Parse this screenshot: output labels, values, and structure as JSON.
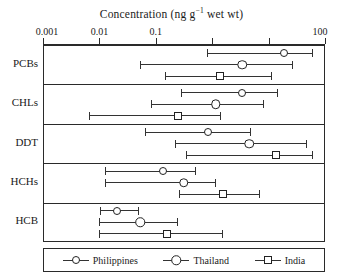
{
  "chart_data": {
    "type": "scatter",
    "orientation": "horizontal",
    "scale": "log",
    "title": "",
    "xlabel": "Concentration (ng g−1 wet wt)",
    "xlabel_parts": {
      "pre": "Concentration (ng g",
      "sup": "−1",
      "post": " wet wt)"
    },
    "ylabel": "",
    "xlim": [
      0.001,
      100
    ],
    "xticks": [
      0.001,
      0.01,
      0.1,
      1,
      10,
      100
    ],
    "xtick_labels": [
      "0.001",
      "0.01",
      "0.1",
      "1",
      "10",
      "100"
    ],
    "xtick_labels_shown": [
      "0.001",
      "0.01",
      "0.1",
      "",
      "",
      "100"
    ],
    "grid": false,
    "legend_position": "bottom",
    "categories": [
      "PCBs",
      "CHLs",
      "DDT",
      "HCHs",
      "HCB"
    ],
    "series": [
      {
        "name": "Philippines",
        "marker": "circle-sm",
        "points": [
          {
            "category": "PCBs",
            "value": 18.0,
            "low": 0.79,
            "high": 60.0
          },
          {
            "category": "CHLs",
            "value": 3.3,
            "low": 0.27,
            "high": 14.0
          },
          {
            "category": "DDT",
            "value": 0.82,
            "low": 0.062,
            "high": 4.6
          },
          {
            "category": "HCHs",
            "value": 0.13,
            "low": 0.012,
            "high": 0.5
          },
          {
            "category": "HCB",
            "value": 0.02,
            "low": 0.0098,
            "high": 0.049
          }
        ]
      },
      {
        "name": "Thailand",
        "marker": "circle-lg",
        "points": [
          {
            "category": "PCBs",
            "value": 3.3,
            "low": 0.05,
            "high": 26.0
          },
          {
            "category": "CHLs",
            "value": 1.1,
            "low": 0.079,
            "high": 7.8
          },
          {
            "category": "DDT",
            "value": 4.4,
            "low": 0.21,
            "high": 46.0
          },
          {
            "category": "HCHs",
            "value": 0.3,
            "low": 0.012,
            "high": 1.1
          },
          {
            "category": "HCB",
            "value": 0.051,
            "low": 0.0096,
            "high": 0.24
          }
        ]
      },
      {
        "name": "India",
        "marker": "square",
        "points": [
          {
            "category": "PCBs",
            "value": 1.3,
            "low": 0.14,
            "high": 11.0
          },
          {
            "category": "CHLs",
            "value": 0.24,
            "low": 0.0062,
            "high": 1.4
          },
          {
            "category": "DDT",
            "value": 13.0,
            "low": 0.33,
            "high": 60.0
          },
          {
            "category": "HCHs",
            "value": 1.5,
            "low": 0.25,
            "high": 6.8
          },
          {
            "category": "HCB",
            "value": 0.15,
            "low": 0.0096,
            "high": 1.5
          }
        ]
      }
    ]
  },
  "legend": {
    "items": [
      {
        "label": "Philippines",
        "marker": "circle-sm"
      },
      {
        "label": "Thailand",
        "marker": "circle-lg"
      },
      {
        "label": "India",
        "marker": "square"
      }
    ]
  },
  "colors": {
    "axis": "#2a2a2a",
    "marker_stroke": "#222222",
    "marker_fill": "#ffffff",
    "text": "#1a1a1a",
    "background": "#ffffff"
  }
}
